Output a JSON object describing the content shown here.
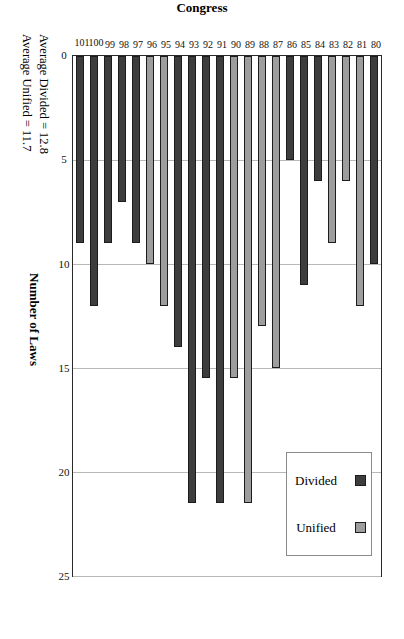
{
  "chart_data": {
    "type": "bar",
    "title": "",
    "orientation": "horizontal-rotated",
    "xlabel": "Congress",
    "ylabel": "Number of Laws",
    "ylim": [
      0,
      25
    ],
    "yticks": [
      0,
      5,
      10,
      15,
      20,
      25
    ],
    "grid": true,
    "legend_position": "top-left",
    "categories": [
      "80",
      "81",
      "82",
      "83",
      "84",
      "85",
      "86",
      "87",
      "88",
      "89",
      "90",
      "91",
      "92",
      "93",
      "94",
      "95",
      "96",
      "97",
      "98",
      "99",
      "100",
      "101"
    ],
    "values": [
      10,
      12,
      6,
      9,
      6,
      11,
      5,
      15,
      13,
      21.5,
      15.5,
      21.5,
      15.5,
      21.5,
      14,
      12,
      10,
      9,
      7,
      9,
      12,
      9
    ],
    "bar_types": [
      "Divided",
      "Unified",
      "Unified",
      "Unified",
      "Divided",
      "Divided",
      "Divided",
      "Unified",
      "Unified",
      "Unified",
      "Unified",
      "Divided",
      "Divided",
      "Divided",
      "Divided",
      "Unified",
      "Unified",
      "Divided",
      "Divided",
      "Divided",
      "Divided",
      "Divided"
    ],
    "series": [
      {
        "name": "Divided",
        "color": "#3d3d3d",
        "points": [
          {
            "category": "80",
            "value": 10
          },
          {
            "category": "84",
            "value": 6
          },
          {
            "category": "85",
            "value": 11
          },
          {
            "category": "86",
            "value": 5
          },
          {
            "category": "91",
            "value": 21.5
          },
          {
            "category": "92",
            "value": 15.5
          },
          {
            "category": "93",
            "value": 21.5
          },
          {
            "category": "94",
            "value": 14
          },
          {
            "category": "97",
            "value": 9
          },
          {
            "category": "98",
            "value": 7
          },
          {
            "category": "99",
            "value": 9
          },
          {
            "category": "100",
            "value": 12
          },
          {
            "category": "101",
            "value": 9
          }
        ]
      },
      {
        "name": "Unified",
        "color": "#9d9d9d",
        "points": [
          {
            "category": "81",
            "value": 12
          },
          {
            "category": "82",
            "value": 6
          },
          {
            "category": "83",
            "value": 9
          },
          {
            "category": "87",
            "value": 15
          },
          {
            "category": "88",
            "value": 13
          },
          {
            "category": "89",
            "value": 21.5
          },
          {
            "category": "90",
            "value": 15.5
          },
          {
            "category": "95",
            "value": 12
          },
          {
            "category": "96",
            "value": 10
          }
        ]
      }
    ],
    "annotations": [
      "Average Divided = 12.8",
      "Average Unified = 11.7"
    ]
  },
  "legend": {
    "items": [
      {
        "label": "Divided",
        "color": "#3d3d3d"
      },
      {
        "label": "Unified",
        "color": "#9d9d9d"
      }
    ]
  },
  "axes": {
    "value_axis_title": "Number of Laws",
    "category_axis_title": "Congress"
  },
  "annotations": {
    "average_divided": "Average Divided = 12.8",
    "average_unified": "Average Unified = 11.7"
  }
}
